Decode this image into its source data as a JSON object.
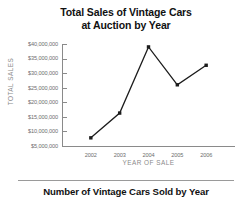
{
  "chart_data": {
    "type": "line",
    "title": "Total Sales of Vintage Cars at Auction by Year",
    "title_lines": [
      "Total Sales of Vintage Cars",
      "at Auction by Year"
    ],
    "xlabel": "YEAR OF SALE",
    "ylabel": "TOTAL SALES",
    "categories": [
      "2002",
      "2003",
      "2004",
      "2005",
      "2006"
    ],
    "values": [
      7800000,
      16300000,
      39000000,
      26000000,
      32700000
    ],
    "ytick_labels": [
      "$40,000,000",
      "$35,000,000",
      "$30,000,000",
      "$25,000,000",
      "$20,000,000",
      "$15,000,000",
      "$10,000,000",
      "$5,000,000"
    ],
    "ytick_values": [
      40000000,
      35000000,
      30000000,
      25000000,
      20000000,
      15000000,
      10000000,
      5000000
    ],
    "ylim": [
      5000000,
      40000000
    ],
    "grid": false,
    "legend": false,
    "marker": "square",
    "line_color": "#1c1c1c",
    "marker_color": "#1c1c1c",
    "axis_color": "#8a8a8a",
    "tick_label_color": "#6e6e6e",
    "axis_title_color": "#8a8a8a",
    "title_color": "#111111"
  },
  "footer": {
    "caption": "Number of Vintage Cars Sold by Year"
  }
}
